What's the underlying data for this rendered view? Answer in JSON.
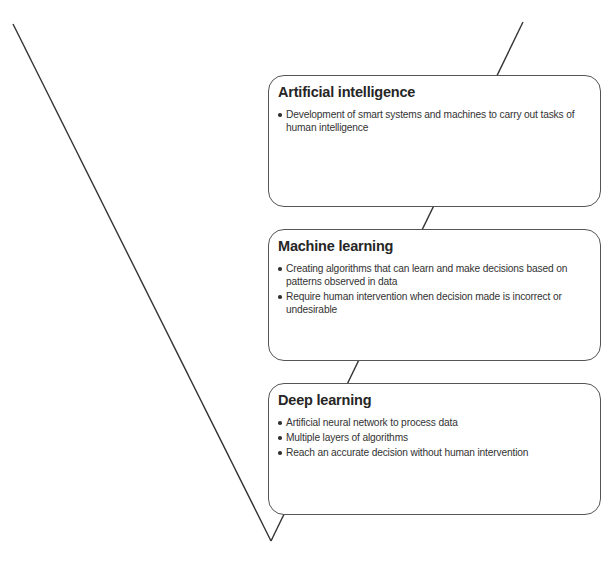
{
  "diagram": {
    "type": "funnel-hierarchy",
    "colors": {
      "line": "#333333",
      "box_border": "#555555",
      "box_fill": "#ffffff",
      "text": "#2a2a2a"
    },
    "levels": [
      {
        "title": "Artificial intelligence",
        "bullets": [
          "Development of smart systems and machines to carry out tasks of human intelligence"
        ]
      },
      {
        "title": "Machine learning",
        "bullets": [
          "Creating algorithms that can learn and make decisions based on patterns observed in data",
          "Require human intervention when decision made is incorrect or undesirable"
        ]
      },
      {
        "title": "Deep learning",
        "bullets": [
          "Artificial neural network to process data",
          "Multiple layers of algorithms",
          "Reach an accurate decision without human intervention"
        ]
      }
    ]
  }
}
